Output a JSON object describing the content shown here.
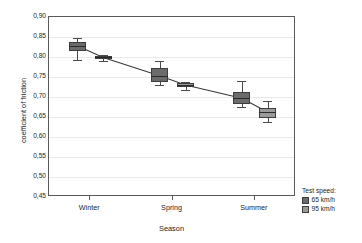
{
  "chart_data": {
    "type": "box",
    "title": "",
    "xlabel": "Season",
    "ylabel": "coefficient of friction",
    "categories": [
      "Winter",
      "Spring",
      "Summer"
    ],
    "ylim": [
      0.45,
      0.9
    ],
    "ytick_step": 0.05,
    "ytick_labels": [
      "0,90",
      "0,85",
      "0,80",
      "0,75",
      "0,70",
      "0,65",
      "0,60",
      "0,55",
      "0,50",
      "0,45"
    ],
    "ytick_values": [
      0.9,
      0.85,
      0.8,
      0.75,
      0.7,
      0.65,
      0.6,
      0.55,
      0.5,
      0.45
    ],
    "grid": true,
    "legend_position": "bottom-right",
    "legend_title": "Test speed:",
    "decimal_separator": ",",
    "connecting_line": true,
    "series": [
      {
        "name": "65 km/h",
        "color": "#6b6b6b",
        "boxes": [
          {
            "category": "Winter",
            "whisker_low": 0.793,
            "q1": 0.815,
            "median": 0.828,
            "q3": 0.838,
            "whisker_high": 0.847
          },
          {
            "category": "Spring",
            "whisker_low": 0.73,
            "q1": 0.738,
            "median": 0.753,
            "q3": 0.773,
            "whisker_high": 0.79
          },
          {
            "category": "Summer",
            "whisker_low": 0.675,
            "q1": 0.683,
            "median": 0.697,
            "q3": 0.712,
            "whisker_high": 0.74
          }
        ]
      },
      {
        "name": "95 km/h",
        "color": "#9a9a9a",
        "boxes": [
          {
            "category": "Winter",
            "whisker_low": 0.79,
            "q1": 0.796,
            "median": 0.799,
            "q3": 0.803,
            "whisker_high": 0.805
          },
          {
            "category": "Spring",
            "whisker_low": 0.718,
            "q1": 0.725,
            "median": 0.73,
            "q3": 0.735,
            "whisker_high": 0.738
          },
          {
            "category": "Summer",
            "whisker_low": 0.638,
            "q1": 0.648,
            "median": 0.662,
            "q3": 0.673,
            "whisker_high": 0.69
          }
        ]
      }
    ]
  },
  "legend": {
    "title": "Test speed:",
    "items": [
      {
        "label": "65 km/h",
        "color": "#6b6b6b"
      },
      {
        "label": "95 km/h",
        "color": "#9a9a9a"
      }
    ]
  },
  "axes": {
    "x_title": "Season",
    "y_title": "coefficient of friction",
    "x_labels": [
      "Winter",
      "Spring",
      "Summer"
    ],
    "y_labels": [
      "0,90",
      "0,85",
      "0,80",
      "0,75",
      "0,70",
      "0,65",
      "0,60",
      "0,55",
      "0,50",
      "0,45"
    ]
  }
}
